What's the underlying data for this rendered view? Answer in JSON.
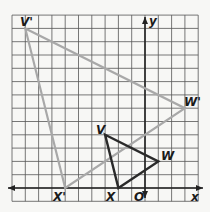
{
  "diagram": {
    "type": "coordinate-plane-dilation",
    "grid": {
      "x_min": -10,
      "x_max": 4,
      "y_min": -1,
      "y_max": 13,
      "origin_px": [
        145,
        188
      ],
      "cell_px": 13.3
    },
    "axes": {
      "x_label": "x",
      "y_label": "y",
      "origin_label": "O"
    },
    "original_triangle": {
      "color": "#2a2a2a",
      "vertices": [
        {
          "name": "V",
          "x": -3,
          "y": 4
        },
        {
          "name": "W",
          "x": 1,
          "y": 2
        },
        {
          "name": "X",
          "x": -2,
          "y": 0
        }
      ]
    },
    "image_triangle": {
      "color": "#a8a8a8",
      "vertices": [
        {
          "name": "V'",
          "x": -9,
          "y": 12
        },
        {
          "name": "W'",
          "x": 3,
          "y": 6
        },
        {
          "name": "X'",
          "x": -6,
          "y": 0
        }
      ]
    },
    "labels": {
      "V": "V",
      "W": "W",
      "X": "X",
      "V_prime": "V'",
      "W_prime": "W'",
      "X_prime": "X'",
      "x_axis": "x",
      "y_axis": "y",
      "origin": "O"
    }
  }
}
